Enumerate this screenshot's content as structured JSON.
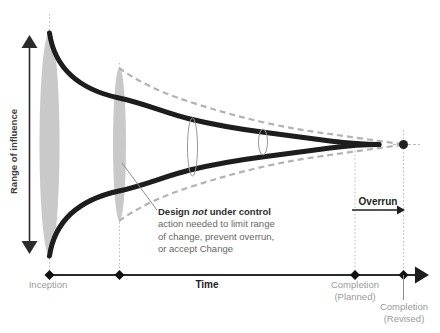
{
  "axes": {
    "y_axis_label": "Range of influence",
    "x_axis_label": "Time"
  },
  "milestones": {
    "inception": "Inception",
    "completion_planned_line1": "Completion",
    "completion_planned_line2": "(Planned)",
    "completion_revised_line1": "Completion",
    "completion_revised_line2": "(Revised)"
  },
  "overrun_label": "Overrun",
  "annotation": {
    "title_pre": "Design ",
    "title_em": "not",
    "title_post": " under control",
    "line2": "action needed to limit range",
    "line3": "of change, prevent overrun,",
    "line4": "or accept Change"
  },
  "colors": {
    "influence_curve": "#1d1d1d",
    "overrun_dashed_curve": "#b3b3b3",
    "uncertainty_ellipse_fill": "#c9c9c9",
    "change_ellipse_stroke": "#999999",
    "milestone_label_gray": "#9b9b9b",
    "axis_dark": "#2b2b2b",
    "dotted_guide": "#b8b8b8",
    "annotation_body": "#666666",
    "annotation_title": "#2d2d2d"
  }
}
